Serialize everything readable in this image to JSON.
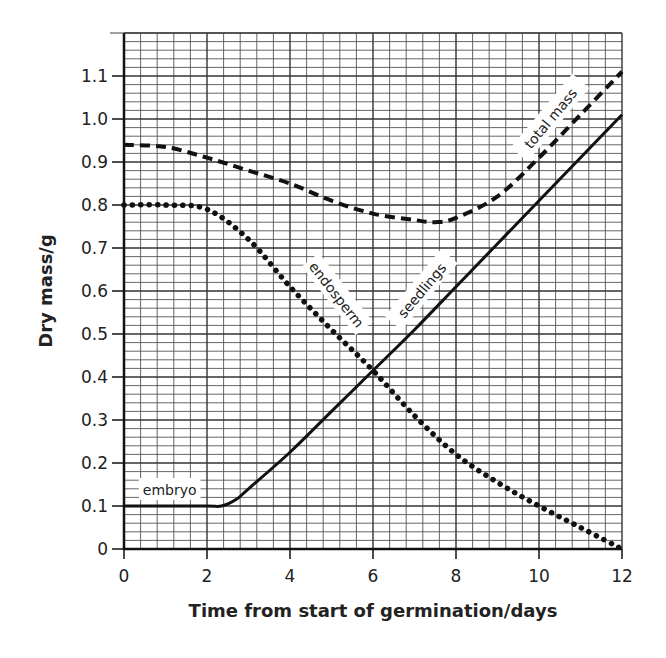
{
  "chart_data": {
    "type": "line",
    "title": "",
    "xlabel": "Time from start of germination/days",
    "ylabel": "Dry mass/g",
    "xlim": [
      0,
      12
    ],
    "ylim": [
      0,
      1.2
    ],
    "grid": true,
    "grid_minor_per_major_x": 5,
    "grid_minor_per_major_y": 5,
    "x_ticks": [
      0,
      2,
      4,
      6,
      8,
      10,
      12
    ],
    "x_tick_labels": [
      "0",
      "2",
      "4",
      "6",
      "8",
      "10",
      "12"
    ],
    "y_ticks": [
      0,
      0.1,
      0.2,
      0.3,
      0.4,
      0.5,
      0.6,
      0.7,
      0.8,
      0.9,
      1.0,
      1.1
    ],
    "y_tick_labels": [
      "0",
      "0.1",
      "0.2",
      "0.3",
      "0.4",
      "0.5",
      "0.6",
      "0.7",
      "0.8",
      "0.9",
      "1.0",
      "1.1"
    ],
    "legend": "none (curves labelled inline)",
    "series": [
      {
        "name": "total mass",
        "style": "dashed",
        "x": [
          0,
          1,
          2,
          3,
          4,
          5,
          6,
          7,
          7.5,
          8,
          9,
          10,
          11,
          12
        ],
        "values": [
          0.94,
          0.935,
          0.91,
          0.88,
          0.85,
          0.81,
          0.78,
          0.765,
          0.76,
          0.77,
          0.82,
          0.91,
          1.01,
          1.11
        ]
      },
      {
        "name": "endosperm",
        "style": "dotted",
        "x": [
          0,
          1,
          2,
          3,
          4,
          5,
          6,
          7,
          8,
          9,
          10,
          11,
          12
        ],
        "values": [
          0.8,
          0.8,
          0.79,
          0.72,
          0.61,
          0.51,
          0.415,
          0.31,
          0.22,
          0.155,
          0.1,
          0.05,
          0.0
        ]
      },
      {
        "name": "embryo / seedlings",
        "style": "solid",
        "x": [
          0,
          1,
          2,
          2.35,
          2.7,
          3,
          4,
          5,
          6,
          7,
          8,
          9,
          10,
          11,
          12
        ],
        "values": [
          0.1,
          0.1,
          0.1,
          0.1,
          0.115,
          0.14,
          0.225,
          0.32,
          0.415,
          0.51,
          0.61,
          0.71,
          0.81,
          0.91,
          1.01
        ]
      }
    ],
    "annotations": [
      {
        "text": "total mass",
        "x": 10.3,
        "y": 1.0,
        "rotation": -50
      },
      {
        "text": "endosperm",
        "x": 5.1,
        "y": 0.59,
        "rotation": 52
      },
      {
        "text": "seedlings",
        "x": 7.2,
        "y": 0.6,
        "rotation": -50
      },
      {
        "text": "embryo",
        "x": 1.1,
        "y": 0.135,
        "rotation": 0
      }
    ]
  }
}
